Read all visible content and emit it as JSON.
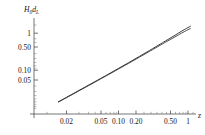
{
  "figure": {
    "name": "luminosity-distance-log-log-plot",
    "background_color": "#ffffff",
    "curve_color": "#1a1a1a",
    "axis_color": "#3a3a3a"
  },
  "labels": {
    "ylabel_main": "H",
    "ylabel_main_sub": "0",
    "ylabel_main_2": "d",
    "ylabel_main_2_sub": "L",
    "ylabel_full": "H0dL",
    "xlabel": "z"
  },
  "chart_data": {
    "type": "line",
    "title": "",
    "xlabel": "z",
    "ylabel": "H0dL",
    "xscale": "log",
    "yscale": "log",
    "grid": false,
    "legend": "none",
    "xlim": [
      0.0125,
      1.15
    ],
    "ylim": [
      0.0125,
      1.45
    ],
    "xticks": [
      0.02,
      0.05,
      0.1,
      0.2,
      0.5,
      1
    ],
    "xtick_labels": [
      "0.02",
      "0.05",
      "0.10",
      "0.20",
      "0.50",
      "1"
    ],
    "yticks": [
      0.05,
      0.1,
      0.5,
      1
    ],
    "ytick_labels": [
      "0.05",
      "0.10",
      "0.50",
      "1"
    ],
    "series": [
      {
        "name": "curve-upper",
        "x": [
          0.0135,
          0.02,
          0.03,
          0.05,
          0.07,
          0.1,
          0.14,
          0.2,
          0.28,
          0.4,
          0.5,
          0.65,
          0.8,
          1.0,
          1.1
        ],
        "y": [
          0.0139,
          0.0208,
          0.0317,
          0.0538,
          0.0765,
          0.1118,
          0.16,
          0.236,
          0.342,
          0.51,
          0.655,
          0.88,
          1.12,
          1.42,
          1.56
        ]
      },
      {
        "name": "curve-lower",
        "x": [
          0.0135,
          0.02,
          0.03,
          0.05,
          0.07,
          0.1,
          0.14,
          0.2,
          0.28,
          0.4,
          0.5,
          0.65,
          0.8,
          1.0,
          1.1
        ],
        "y": [
          0.0136,
          0.0203,
          0.0308,
          0.0522,
          0.074,
          0.1078,
          0.1535,
          0.225,
          0.323,
          0.474,
          0.603,
          0.795,
          0.995,
          1.24,
          1.35
        ]
      }
    ]
  }
}
